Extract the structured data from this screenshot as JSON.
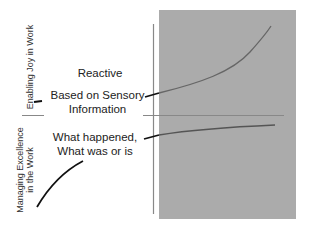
{
  "diagram": {
    "y_axis_top_label": "Enabling Joy in Work",
    "y_axis_bottom_label_line1": "Managing Excellence",
    "y_axis_bottom_label_line2": "in the Work",
    "top_title": "Reactive",
    "top_desc_line1": "Based on Sensory",
    "top_desc_line2": "Information",
    "bottom_desc_line1": "What happened,",
    "bottom_desc_line2": "What was or is",
    "colors": {
      "panel": "#ababab",
      "curve_on_panel": "#666666",
      "curve_outside": "#111111",
      "divider": "#888888"
    }
  }
}
